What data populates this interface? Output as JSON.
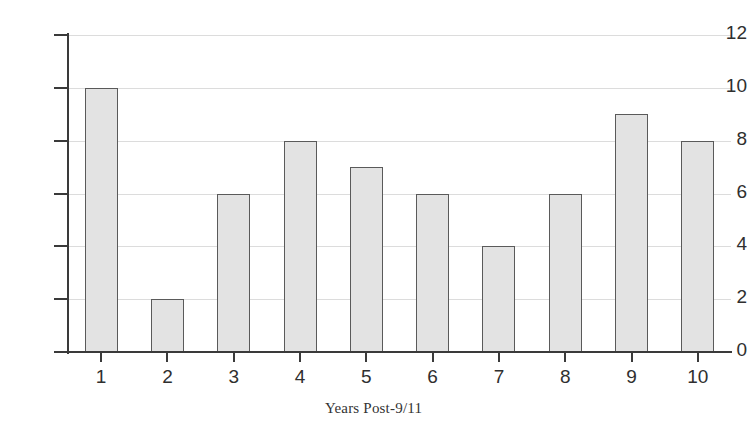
{
  "chart_data": {
    "type": "bar",
    "title": "",
    "subtitle": "",
    "xlabel": "Years Post-9/11",
    "ylabel": "",
    "categories": [
      "1",
      "2",
      "3",
      "4",
      "5",
      "6",
      "7",
      "8",
      "9",
      "10"
    ],
    "values": [
      10,
      2,
      6,
      8,
      7,
      6,
      4,
      6,
      9,
      8
    ],
    "ylim": [
      0,
      12
    ],
    "y_ticks": [
      "0",
      "2",
      "4",
      "6",
      "8",
      "10",
      "12"
    ],
    "y_tick_values": [
      0,
      2,
      4,
      6,
      8,
      10,
      12
    ],
    "grid": "horizontal",
    "legend": "none",
    "annotations": [],
    "colors": {
      "bar_fill": "#e3e3e3",
      "bar_border": "#5a5a5a",
      "gridline": "#dcdcdc",
      "axis": "#3a3a3a",
      "text": "#2f2f2f",
      "background": "#ffffff"
    }
  }
}
